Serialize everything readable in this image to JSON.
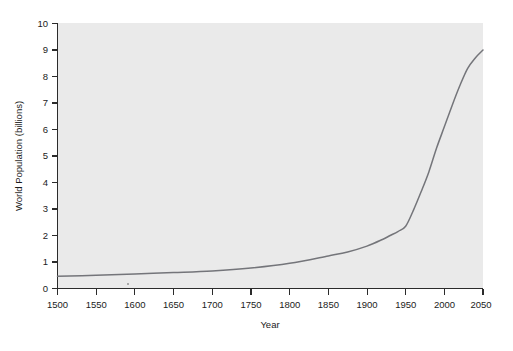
{
  "figure": {
    "background_color": "#ffffff",
    "plot_background_color": "#eaeaea",
    "line_color": "#74757a",
    "axis_color": "#2b2b2b",
    "text_color": "#1b1b1b",
    "rule_color": "#151515"
  },
  "chart_data": {
    "type": "line",
    "title": "",
    "xlabel": "Year",
    "ylabel": "World Population (billions)",
    "xlim": [
      1500,
      2050
    ],
    "ylim": [
      0,
      10
    ],
    "xticks": [
      1500,
      1550,
      1600,
      1650,
      1700,
      1750,
      1800,
      1850,
      1900,
      1950,
      2000,
      2050
    ],
    "xtick_labels": [
      "1500",
      "1550",
      "1600",
      "1650",
      "1700",
      "1750",
      "1800",
      "1850",
      "1900",
      "1950",
      "2000",
      "2050"
    ],
    "yticks": [
      0,
      1,
      2,
      3,
      4,
      5,
      6,
      7,
      8,
      9,
      10
    ],
    "ytick_labels": [
      "0",
      "1",
      "2",
      "3",
      "4",
      "5",
      "6",
      "7",
      "8",
      "9",
      "10"
    ],
    "grid": false,
    "legend": false,
    "series": [
      {
        "name": "World Population",
        "x": [
          1500,
          1550,
          1600,
          1650,
          1700,
          1750,
          1800,
          1850,
          1875,
          1900,
          1920,
          1930,
          1940,
          1950,
          1960,
          1970,
          1980,
          1990,
          2000,
          2010,
          2020,
          2030,
          2040,
          2050
        ],
        "values": [
          0.46,
          0.5,
          0.55,
          0.6,
          0.66,
          0.77,
          0.95,
          1.23,
          1.38,
          1.6,
          1.85,
          2.0,
          2.15,
          2.35,
          2.95,
          3.65,
          4.4,
          5.3,
          6.1,
          6.9,
          7.65,
          8.3,
          8.7,
          9.0
        ]
      }
    ]
  },
  "rule": {
    "label": "horizontal-divider"
  }
}
